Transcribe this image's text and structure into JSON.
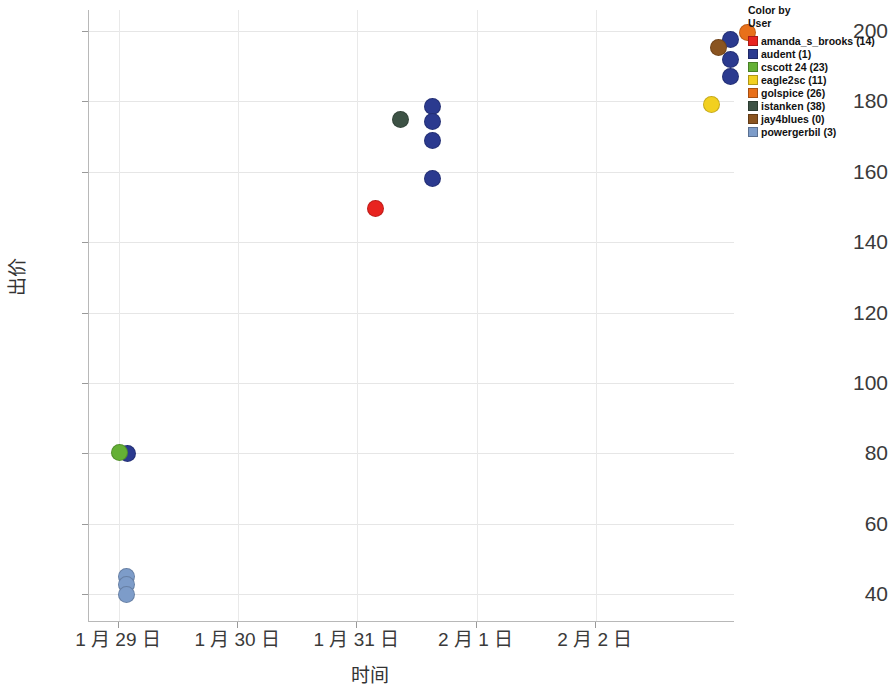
{
  "chart_data": {
    "type": "scatter",
    "title": "",
    "xlabel": "时间",
    "ylabel": "出价",
    "ylim": [
      32,
      206
    ],
    "yticks": [
      40,
      60,
      80,
      100,
      120,
      140,
      160,
      180,
      200
    ],
    "xticks": [
      "1 月 29 日",
      "1 月 30 日",
      "1 月 31 日",
      "2 月 1 日",
      "2 月 2 日"
    ],
    "grid": true,
    "legend_position": "top-right",
    "colorby": "User",
    "series": [
      {
        "name": "amanda_s_brooks",
        "count": "14",
        "color": "#e8231f",
        "points": [
          {
            "x": 2.15,
            "y": 149.5
          }
        ]
      },
      {
        "name": "audent",
        "count": "1",
        "color": "#2b3a8f",
        "points": [
          {
            "x": 0.07,
            "y": 80.0
          },
          {
            "x": 2.63,
            "y": 178.7
          },
          {
            "x": 2.63,
            "y": 174.2
          },
          {
            "x": 2.63,
            "y": 169.0
          },
          {
            "x": 2.63,
            "y": 158.2
          },
          {
            "x": 5.13,
            "y": 197.5
          },
          {
            "x": 5.13,
            "y": 192.0
          },
          {
            "x": 5.13,
            "y": 187.0
          }
        ]
      },
      {
        "name": "cscott 24",
        "count": "23",
        "color": "#64b035",
        "points": [
          {
            "x": 0.0,
            "y": 80.2
          }
        ]
      },
      {
        "name": "eagle2sc",
        "count": "11",
        "color": "#f2d020",
        "points": [
          {
            "x": 4.97,
            "y": 179.1
          }
        ]
      },
      {
        "name": "golspice",
        "count": "26",
        "color": "#e8701a",
        "points": [
          {
            "x": 5.27,
            "y": 199.5
          }
        ]
      },
      {
        "name": "istanken",
        "count": "38",
        "color": "#3d5245",
        "points": [
          {
            "x": 2.36,
            "y": 175.0
          }
        ]
      },
      {
        "name": "jay4blues",
        "count": "0",
        "color": "#8a5420",
        "points": [
          {
            "x": 5.03,
            "y": 195.4
          }
        ]
      },
      {
        "name": "powergerbil",
        "count": "3",
        "color": "#7d9cc9",
        "points": [
          {
            "x": 0.06,
            "y": 45.0
          },
          {
            "x": 0.06,
            "y": 42.6
          },
          {
            "x": 0.06,
            "y": 39.8
          }
        ]
      }
    ]
  },
  "legend": {
    "title": "Color by\nUser",
    "entries": [
      {
        "label": "amanda_s_brooks (14)",
        "color": "#e8231f"
      },
      {
        "label": "audent (1)",
        "color": "#2b3a8f"
      },
      {
        "label": "cscott 24 (23)",
        "color": "#64b035"
      },
      {
        "label": "eagle2sc (11)",
        "color": "#f2d020"
      },
      {
        "label": "golspice (26)",
        "color": "#e8701a"
      },
      {
        "label": "istanken (38)",
        "color": "#3d5245"
      },
      {
        "label": "jay4blues (0)",
        "color": "#8a5420"
      },
      {
        "label": "powergerbil (3)",
        "color": "#7d9cc9"
      }
    ]
  }
}
